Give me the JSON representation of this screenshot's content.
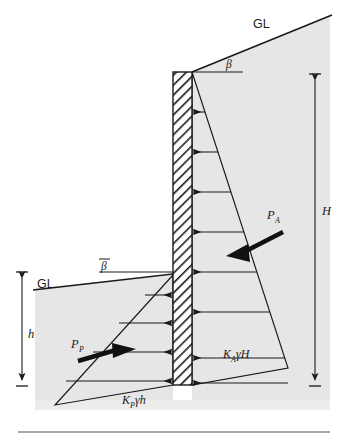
{
  "figure": {
    "kind": "retaining-wall-earth-pressure-diagram",
    "background_color": "#ffffff",
    "soil_fill_color": "#e6e6e6",
    "line_color": "#1a1a1a",
    "wall_hatch_color": "#1a1a1a",
    "resultant_arrow_color": "#111111"
  },
  "labels": {
    "ground_line_top": "GL",
    "ground_line_left": "GL",
    "slope_angle_top": "β",
    "slope_angle_left": "β",
    "slope_angle_left_overbar": true,
    "active_resultant": "P",
    "active_resultant_sub": "A",
    "passive_resultant": "P",
    "passive_resultant_sub": "P",
    "height_total": "H",
    "height_embedment": "h",
    "active_pressure": "K",
    "active_pressure_sub": "A",
    "active_pressure_tail": "γH",
    "passive_pressure": "K",
    "passive_pressure_sub": "P",
    "passive_pressure_tail": "γh"
  },
  "dimensions": {
    "total_height_line": {
      "x": 315,
      "y_top": 78,
      "y_bottom": 382,
      "label": "H"
    },
    "embedment_height_line": {
      "x": 22,
      "y_top": 272,
      "y_bottom": 385,
      "label": "h"
    }
  },
  "wall": {
    "left_x": 173,
    "right_x": 192,
    "top_y": 72,
    "bottom_y": 385,
    "hatch_pattern": "diagonal-45"
  },
  "active_side": {
    "description": "Active earth pressure triangle on right face of wall, arrows pointing left into wall",
    "arrow_count": 7,
    "apex_y": 72,
    "base_y": 385,
    "max_pressure_x": 288,
    "pressure_label": "K_A γ H",
    "resultant_label": "P_A"
  },
  "passive_side": {
    "description": "Passive earth pressure triangle on left face of wall, arrows pointing right into wall",
    "arrow_count": 4,
    "apex_y": 275,
    "base_y": 385,
    "min_pressure_x": 55,
    "pressure_label": "K_P γ h",
    "resultant_label": "P_P"
  },
  "footer_rule": {
    "present": true,
    "y": 432
  }
}
